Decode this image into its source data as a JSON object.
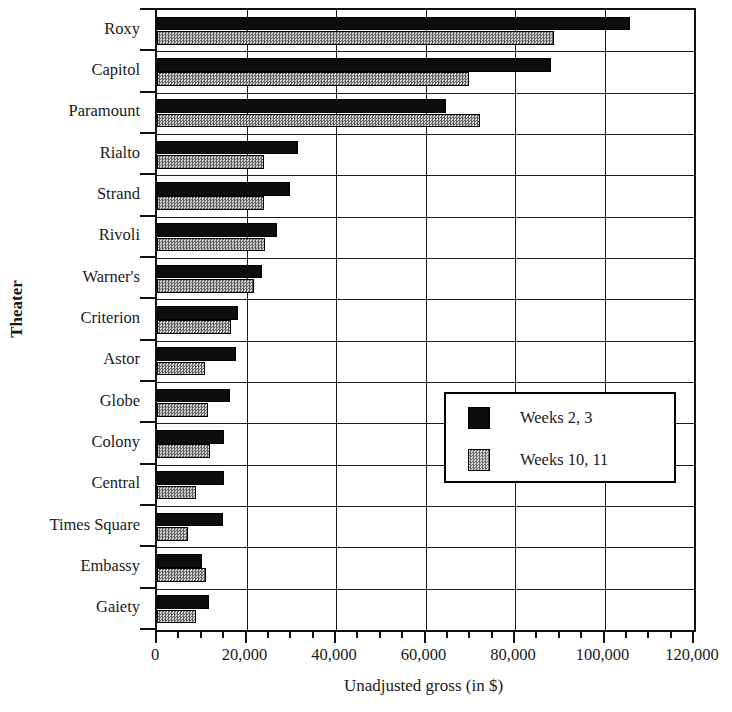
{
  "chart_data": {
    "type": "bar",
    "orientation": "horizontal",
    "title": "",
    "xlabel": "Unadjusted gross (in $)",
    "ylabel": "Theater",
    "xlim": [
      0,
      120000
    ],
    "xticks": [
      0,
      20000,
      40000,
      60000,
      80000,
      100000,
      120000
    ],
    "xtick_labels": [
      "0",
      "20,000",
      "40,000",
      "60,000",
      "80,000",
      "100,000",
      "120,000"
    ],
    "minor_tick_interval": 5000,
    "grid": "vertical-and-horizontal",
    "legend_position": "middle-right-inside",
    "categories": [
      "Roxy",
      "Capitol",
      "Paramount",
      "Rialto",
      "Strand",
      "Rivoli",
      "Warner's",
      "Criterion",
      "Astor",
      "Globe",
      "Colony",
      "Central",
      "Times Square",
      "Embassy",
      "Gaiety"
    ],
    "series": [
      {
        "name": "Weeks 2, 3",
        "color": "#0d0d0d",
        "pattern": "solid",
        "values": [
          105800,
          88000,
          64500,
          31500,
          29700,
          26800,
          23400,
          18100,
          17700,
          16300,
          15000,
          15000,
          14700,
          10100,
          11600
        ]
      },
      {
        "name": "Weeks 10, 11",
        "color": "#9a9a9a",
        "pattern": "checker-50",
        "values": [
          88800,
          69700,
          72200,
          24000,
          24000,
          24100,
          21700,
          16500,
          10700,
          11400,
          11900,
          8700,
          7000,
          11000,
          8700
        ]
      }
    ]
  },
  "legend": {
    "entries": [
      {
        "label": "Weeks 2, 3"
      },
      {
        "label": "Weeks 10, 11"
      }
    ]
  }
}
